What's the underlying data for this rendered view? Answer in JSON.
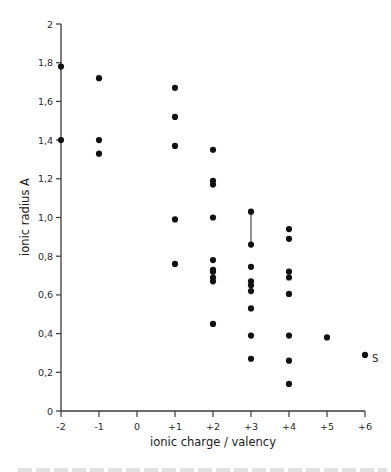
{
  "chart_data": {
    "type": "scatter",
    "title": "",
    "xlabel": "ionic charge / valency",
    "ylabel": "ionic radius A",
    "xlim": [
      -2,
      6
    ],
    "ylim": [
      0,
      2
    ],
    "grid": false,
    "legend": null,
    "x_ticks": [
      {
        "value": -2,
        "label": "-2"
      },
      {
        "value": -1,
        "label": "-1"
      },
      {
        "value": 0,
        "label": "0"
      },
      {
        "value": 1,
        "label": "+1"
      },
      {
        "value": 2,
        "label": "+2"
      },
      {
        "value": 3,
        "label": "+3"
      },
      {
        "value": 4,
        "label": "+4"
      },
      {
        "value": 5,
        "label": "+5"
      },
      {
        "value": 6,
        "label": "+6"
      }
    ],
    "y_ticks": [
      {
        "value": 0,
        "label": "0"
      },
      {
        "value": 0.2,
        "label": "0,2"
      },
      {
        "value": 0.4,
        "label": "0,4"
      },
      {
        "value": 0.6,
        "label": "0,6"
      },
      {
        "value": 0.8,
        "label": "0,8"
      },
      {
        "value": 1.0,
        "label": "1,0"
      },
      {
        "value": 1.2,
        "label": "1,2"
      },
      {
        "value": 1.4,
        "label": "1,4"
      },
      {
        "value": 1.6,
        "label": "1,6"
      },
      {
        "value": 1.8,
        "label": "1,8"
      },
      {
        "value": 2,
        "label": "2"
      }
    ],
    "series": [
      {
        "name": "ions",
        "points": [
          {
            "x": -2,
            "y": 1.78
          },
          {
            "x": -2,
            "y": 1.4
          },
          {
            "x": -1,
            "y": 1.72
          },
          {
            "x": -1,
            "y": 1.4
          },
          {
            "x": -1,
            "y": 1.33
          },
          {
            "x": 1,
            "y": 1.67
          },
          {
            "x": 1,
            "y": 1.52
          },
          {
            "x": 1,
            "y": 1.37
          },
          {
            "x": 1,
            "y": 0.99
          },
          {
            "x": 1,
            "y": 0.76
          },
          {
            "x": 2,
            "y": 1.35
          },
          {
            "x": 2,
            "y": 1.19
          },
          {
            "x": 2,
            "y": 1.17
          },
          {
            "x": 2,
            "y": 1.0
          },
          {
            "x": 2,
            "y": 0.78
          },
          {
            "x": 2,
            "y": 0.73
          },
          {
            "x": 2,
            "y": 0.72
          },
          {
            "x": 2,
            "y": 0.69
          },
          {
            "x": 2,
            "y": 0.67
          },
          {
            "x": 2,
            "y": 0.45
          },
          {
            "x": 3,
            "y": 1.03
          },
          {
            "x": 3,
            "y": 0.86
          },
          {
            "x": 3,
            "y": 0.745
          },
          {
            "x": 3,
            "y": 0.67
          },
          {
            "x": 3,
            "y": 0.65
          },
          {
            "x": 3,
            "y": 0.62
          },
          {
            "x": 3,
            "y": 0.53
          },
          {
            "x": 3,
            "y": 0.39
          },
          {
            "x": 3,
            "y": 0.27
          },
          {
            "x": 4,
            "y": 0.94
          },
          {
            "x": 4,
            "y": 0.89
          },
          {
            "x": 4,
            "y": 0.72
          },
          {
            "x": 4,
            "y": 0.69
          },
          {
            "x": 4,
            "y": 0.605
          },
          {
            "x": 4,
            "y": 0.39
          },
          {
            "x": 4,
            "y": 0.26
          },
          {
            "x": 4,
            "y": 0.14
          },
          {
            "x": 5,
            "y": 0.38
          },
          {
            "x": 6,
            "y": 0.29,
            "label": "S"
          }
        ]
      }
    ],
    "connectors": [
      {
        "x1": 3,
        "y1": 1.03,
        "x2": 3,
        "y2": 0.86
      }
    ]
  },
  "colors": {
    "axis": "#3a3a3a",
    "marker": "#111111",
    "connector": "#777777",
    "text": "#1a1a1a"
  }
}
